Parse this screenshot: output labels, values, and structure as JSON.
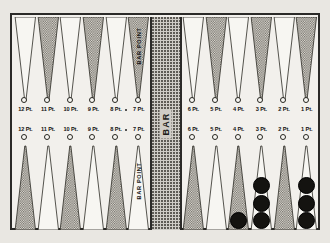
{
  "figure": {
    "bar_label": "BAR",
    "bar_point_label": "BAR POINT",
    "colors": {
      "page_background": "#e9e7e2",
      "board_background": "#f2f0ec",
      "frame": "#2b2a28",
      "stipple_fill": "#cfccc6",
      "checker": "#141310"
    }
  },
  "quadrants": {
    "top_left": {
      "name": "top-left",
      "points": [
        {
          "label": "12 Pt.",
          "filled": false,
          "checkers": 0
        },
        {
          "label": "11 Pt.",
          "filled": true,
          "checkers": 0
        },
        {
          "label": "10 Pt.",
          "filled": false,
          "checkers": 0
        },
        {
          "label": "9 Pt.",
          "filled": true,
          "checkers": 0
        },
        {
          "label": "8 Pt.",
          "filled": false,
          "checkers": 0
        },
        {
          "label": "7 Pt.",
          "filled": true,
          "checkers": 0,
          "bar_point": true
        }
      ]
    },
    "top_right": {
      "name": "top-right",
      "points": [
        {
          "label": "6 Pt.",
          "filled": false,
          "checkers": 0
        },
        {
          "label": "5 Pt.",
          "filled": true,
          "checkers": 0
        },
        {
          "label": "4 Pt.",
          "filled": false,
          "checkers": 0
        },
        {
          "label": "3 Pt.",
          "filled": true,
          "checkers": 0
        },
        {
          "label": "2 Pt.",
          "filled": false,
          "checkers": 0
        },
        {
          "label": "1 Pt.",
          "filled": true,
          "checkers": 0
        }
      ]
    },
    "bottom_left": {
      "name": "bottom-left",
      "points": [
        {
          "label": "12 Pt.",
          "filled": true,
          "checkers": 0
        },
        {
          "label": "11 Pt.",
          "filled": false,
          "checkers": 0
        },
        {
          "label": "10 Pt.",
          "filled": true,
          "checkers": 0
        },
        {
          "label": "9 Pt.",
          "filled": false,
          "checkers": 0
        },
        {
          "label": "8 Pt.",
          "filled": true,
          "checkers": 0
        },
        {
          "label": "7 Pt.",
          "filled": false,
          "checkers": 0,
          "bar_point": true
        }
      ]
    },
    "bottom_right": {
      "name": "bottom-right",
      "points": [
        {
          "label": "6 Pt.",
          "filled": true,
          "checkers": 0
        },
        {
          "label": "5 Pt.",
          "filled": false,
          "checkers": 0
        },
        {
          "label": "4 Pt.",
          "filled": true,
          "checkers": 1
        },
        {
          "label": "3 Pt.",
          "filled": false,
          "checkers": 3
        },
        {
          "label": "2 Pt.",
          "filled": true,
          "checkers": 0
        },
        {
          "label": "1 Pt.",
          "filled": false,
          "checkers": 3
        }
      ]
    }
  }
}
